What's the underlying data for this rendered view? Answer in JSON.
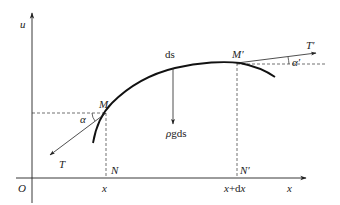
{
  "diagram": {
    "type": "physics free-body diagram of a hanging chain/string element",
    "axes": {
      "vertical_label": "u",
      "horizontal_label": "x",
      "origin_label": "O"
    },
    "points": {
      "M": "M",
      "M_prime": "M′",
      "N": "N",
      "N_prime": "N′"
    },
    "tick_labels": {
      "x": "x",
      "x_plus_dx": "x+dx"
    },
    "forces": {
      "tension_left": "T",
      "tension_right": "T′",
      "weight": "ρgds"
    },
    "angles": {
      "alpha": "α",
      "alpha_prime": "α′"
    },
    "element_label": "ds",
    "colors": {
      "stroke": "#222222",
      "background": "#ffffff"
    }
  }
}
